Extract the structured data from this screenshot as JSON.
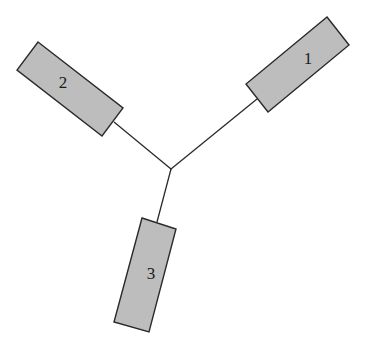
{
  "diagram": {
    "junction": {
      "x": 171,
      "y": 169
    },
    "colors": {
      "background": "#ffffff",
      "box_fill": "#bdbdbd",
      "stroke": "#2a2a2a"
    },
    "nodes": [
      {
        "id": "1",
        "label": "1",
        "points": "327,17 349,45 268,112 246,84",
        "label_pos": {
          "x": 308,
          "y": 64
        },
        "connector_end": {
          "x": 257,
          "y": 99
        }
      },
      {
        "id": "2",
        "label": "2",
        "points": "38,42 123,108 102,136 17,70",
        "label_pos": {
          "x": 63,
          "y": 88
        },
        "connector_end": {
          "x": 114,
          "y": 122
        }
      },
      {
        "id": "3",
        "label": "3",
        "points": "142,218 176,229 149,332 114,322",
        "label_pos": {
          "x": 151,
          "y": 279
        },
        "connector_end": {
          "x": 157,
          "y": 222
        }
      }
    ]
  }
}
